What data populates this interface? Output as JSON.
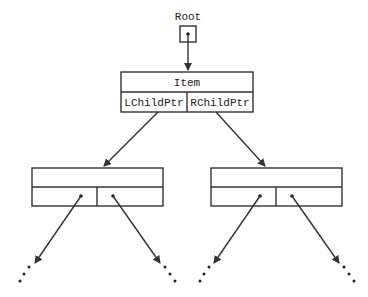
{
  "diagram": {
    "root": {
      "label": "Root"
    },
    "root_node": {
      "item_label": "Item",
      "left_ptr_label": "LChildPtr",
      "right_ptr_label": "RChildPtr"
    },
    "children": [
      {
        "name": "left-child",
        "item_label": "",
        "left_ptr_label": "",
        "right_ptr_label": ""
      },
      {
        "name": "right-child",
        "item_label": "",
        "left_ptr_label": "",
        "right_ptr_label": ""
      }
    ],
    "continuation_marker": "...",
    "colors": {
      "stroke": "#333333",
      "background": "#ffffff",
      "text": "#222222"
    }
  }
}
